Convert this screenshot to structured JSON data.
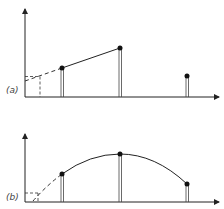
{
  "panels": [
    {
      "id": "a",
      "label": "(a)",
      "description": "Linear extrapolation between two sampled points; third sample outside line",
      "points": [
        {
          "x": 62,
          "y": 68
        },
        {
          "x": 120,
          "y": 48
        },
        {
          "x": 187,
          "y": 76
        }
      ],
      "curve": "line"
    },
    {
      "id": "b",
      "label": "(b)",
      "description": "Quadratic curve fitted through three sampled points, extrapolated back",
      "points": [
        {
          "x": 62,
          "y": 174
        },
        {
          "x": 120,
          "y": 154
        },
        {
          "x": 187,
          "y": 184
        }
      ],
      "curve": "parabola"
    }
  ],
  "colors": {
    "line": "#222222",
    "bar": "#555555",
    "dot": "#111111",
    "dashed": "#333333"
  }
}
